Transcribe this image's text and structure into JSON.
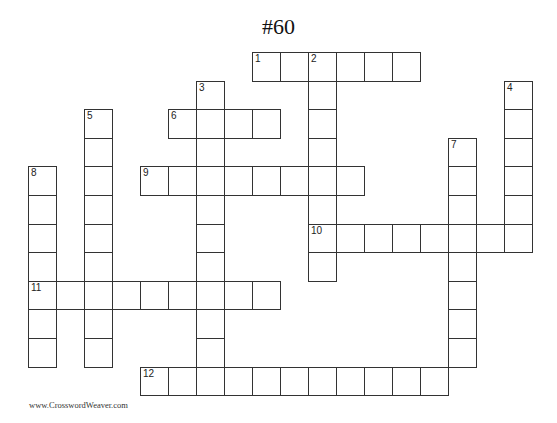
{
  "title": "#60",
  "footer": "www.CrosswordWeaver.com",
  "grid": {
    "origin_x": 28,
    "origin_y": 52,
    "cell_w": 28,
    "cell_h": 28.6
  },
  "entries": [
    {
      "number": "1",
      "direction": "across",
      "row": 0,
      "col": 8,
      "length": 6
    },
    {
      "number": "2",
      "direction": "down",
      "row": 0,
      "col": 10,
      "length": 8
    },
    {
      "number": "3",
      "direction": "down",
      "row": 1,
      "col": 6,
      "length": 11
    },
    {
      "number": "4",
      "direction": "down",
      "row": 1,
      "col": 17,
      "length": 6
    },
    {
      "number": "5",
      "direction": "down",
      "row": 2,
      "col": 2,
      "length": 9
    },
    {
      "number": "6",
      "direction": "across",
      "row": 2,
      "col": 5,
      "length": 4
    },
    {
      "number": "7",
      "direction": "down",
      "row": 3,
      "col": 15,
      "length": 8
    },
    {
      "number": "8",
      "direction": "down",
      "row": 4,
      "col": 0,
      "length": 7
    },
    {
      "number": "9",
      "direction": "across",
      "row": 4,
      "col": 4,
      "length": 8
    },
    {
      "number": "10",
      "direction": "across",
      "row": 6,
      "col": 10,
      "length": 8
    },
    {
      "number": "11",
      "direction": "across",
      "row": 8,
      "col": 0,
      "length": 9
    },
    {
      "number": "12",
      "direction": "across",
      "row": 11,
      "col": 4,
      "length": 11
    }
  ]
}
